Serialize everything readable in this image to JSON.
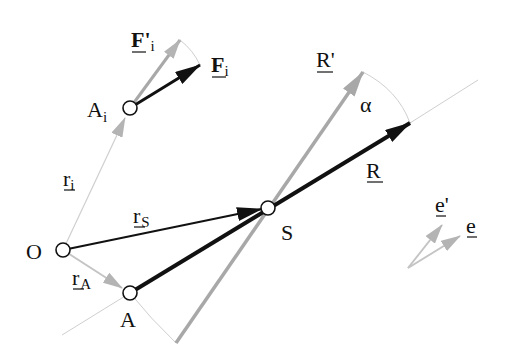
{
  "diagram": {
    "colors": {
      "black_vector": "#111111",
      "gray_vector": "#a8a8a8",
      "thin_line": "#c8c8c8",
      "point_fill": "#ffffff",
      "point_stroke": "#111111"
    },
    "points": [
      {
        "id": "O",
        "label": "O",
        "x": 63,
        "y": 250
      },
      {
        "id": "A",
        "label": "A",
        "x": 130,
        "y": 293
      },
      {
        "id": "Ai",
        "label": "A",
        "sub": "i",
        "x": 130,
        "y": 108
      },
      {
        "id": "S",
        "label": "S",
        "x": 268,
        "y": 208
      }
    ],
    "labels": {
      "O": "O",
      "A": "A",
      "Ai_main": "A",
      "Ai_sub": "i",
      "S": "S",
      "r_i_main": "r",
      "r_i_sub": "i",
      "r_S_main": "r",
      "r_S_sub": "S",
      "r_A_main": "r",
      "r_A_sub": "A",
      "F_i_main": "F",
      "F_i_sub": "i",
      "F_prime_i_main": "F'",
      "F_prime_i_sub": "i",
      "R": "R",
      "R_prime": "R'",
      "alpha": "α",
      "e": "e",
      "e_prime": "e'"
    },
    "vectors": [
      {
        "name": "r_i",
        "from": "O",
        "to": "Ai",
        "style": "thin-gray"
      },
      {
        "name": "r_S",
        "from": "O",
        "to": "S",
        "style": "black"
      },
      {
        "name": "r_A",
        "from": "O",
        "to": "A",
        "style": "gray"
      },
      {
        "name": "R",
        "from": "A",
        "to": "R-tip",
        "style": "black-thick"
      },
      {
        "name": "R'",
        "from": "S",
        "to": "R'-tip",
        "style": "gray-thick"
      },
      {
        "name": "F_i",
        "from": "Ai",
        "to": "F_i-tip",
        "style": "black"
      },
      {
        "name": "F'_i",
        "from": "Ai",
        "to": "F'_i-tip",
        "style": "gray"
      },
      {
        "name": "e",
        "style": "gray-small"
      },
      {
        "name": "e'",
        "style": "gray-small"
      }
    ],
    "angle": {
      "label": "α",
      "between": [
        "R",
        "R'"
      ]
    }
  }
}
